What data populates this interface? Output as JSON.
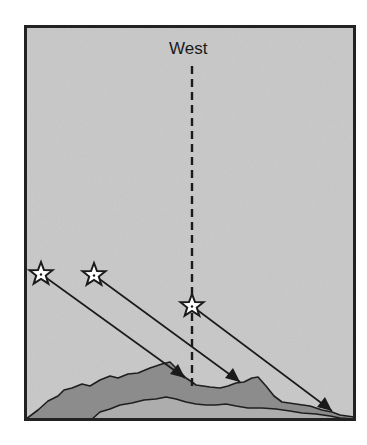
{
  "diagram": {
    "label": "West",
    "colors": {
      "background": "#cbcbcb",
      "frame": "#222222",
      "back_mountain": "#8c8c8c",
      "front_mountain": "#adadad",
      "line": "#1a1a1a",
      "star_fill": "#ffffff"
    },
    "stars": [
      {
        "id": 1,
        "x": 41,
        "y": 274
      },
      {
        "id": 2,
        "x": 94,
        "y": 275
      },
      {
        "id": 3,
        "x": 192,
        "y": 306
      }
    ],
    "arrows": [
      {
        "from": 1,
        "to_x": 185,
        "to_y": 378
      },
      {
        "from": 2,
        "to_x": 240,
        "to_y": 382
      },
      {
        "from": 3,
        "to_x": 332,
        "to_y": 411
      }
    ],
    "meridian": {
      "x": 192,
      "y_start": 66,
      "y_end": 388,
      "style": "dashed"
    }
  }
}
